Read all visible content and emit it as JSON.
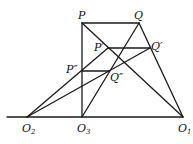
{
  "diagram": {
    "title": "",
    "colors": {
      "line": "#1a1a1a",
      "background": "#ffffff",
      "text": "#111111"
    },
    "points": {
      "P": {
        "x": 82,
        "y": 23,
        "label": "P"
      },
      "Q": {
        "x": 139,
        "y": 23,
        "label": "Q"
      },
      "P1": {
        "x": 108,
        "y": 48,
        "label": "P′"
      },
      "Q1": {
        "x": 150,
        "y": 48,
        "label": "Q′"
      },
      "P2": {
        "x": 82,
        "y": 71,
        "label": "P″"
      },
      "Q2": {
        "x": 109,
        "y": 71,
        "label": "Q″"
      },
      "O2": {
        "x": 27,
        "y": 117,
        "label": "O",
        "sub": "2"
      },
      "O3": {
        "x": 82,
        "y": 117,
        "label": "O",
        "sub": "3"
      },
      "O1": {
        "x": 183,
        "y": 117,
        "label": "O",
        "sub": "1"
      },
      "L": {
        "x": 7,
        "y": 117
      }
    },
    "segments": [
      [
        "P",
        "Q"
      ],
      [
        "P",
        "O3"
      ],
      [
        "P",
        "O1"
      ],
      [
        "Q",
        "O1"
      ],
      [
        "Q",
        "O3"
      ],
      [
        "P1",
        "Q1"
      ],
      [
        "P2",
        "Q2"
      ],
      [
        "O2",
        "P1"
      ],
      [
        "O2",
        "Q1"
      ],
      [
        "L",
        "O1"
      ]
    ]
  }
}
